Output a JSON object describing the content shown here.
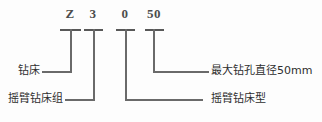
{
  "diagram": {
    "line_color": "#6a6a6a",
    "text_color": "#2e2e2e",
    "background": "#fdfdfd",
    "code_segments": [
      {
        "id": "seg-z",
        "char": "Z",
        "meaning": "钻床"
      },
      {
        "id": "seg-3",
        "char": "3",
        "meaning": "摇臂钻床组"
      },
      {
        "id": "seg-0",
        "char": "0",
        "meaning": "摇臂钻床型"
      },
      {
        "id": "seg-50",
        "char": "50",
        "meaning": "最大钻孔直径50mm"
      }
    ],
    "labels": {
      "drill_machine": "钻床",
      "radial_group": "摇臂钻床组",
      "radial_type": "摇臂钻床型",
      "max_diameter": "最大钻孔直径50mm"
    }
  }
}
